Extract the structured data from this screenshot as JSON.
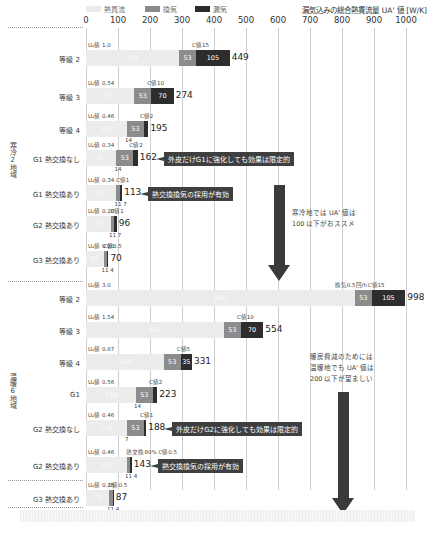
{
  "chart_data": {
    "type": "bar",
    "orientation": "horizontal-stacked",
    "title": "漏気込みの総合熱貫流量 UA' 値 [W/K]",
    "xlim": [
      0,
      1000
    ],
    "xticks": [
      0,
      100,
      200,
      300,
      400,
      500,
      600,
      700,
      800,
      900,
      1000
    ],
    "legend": [
      {
        "name": "熱貫流",
        "color": "#ebebeb"
      },
      {
        "name": "換気",
        "color": "#8a8a8a"
      },
      {
        "name": "漏気",
        "color": "#2b2b2b"
      }
    ],
    "groups": [
      {
        "name": "寒冷2地域",
        "rows": [
          {
            "label": "等級 2",
            "ua": "Uₐ値 1.0",
            "c": "C値15",
            "heat": 291,
            "vent": 53,
            "leak": 105,
            "total": 449
          },
          {
            "label": "等級 3",
            "ua": "Uₐ値 0.54",
            "c": "C値10",
            "heat": 151,
            "vent": 53,
            "leak": 70,
            "total": 274
          },
          {
            "label": "等級 4",
            "ua": "Uₐ値 0.46",
            "c": "C値2",
            "heat": 128,
            "vent": 53,
            "leak": 14,
            "total": 195,
            "below": "14"
          },
          {
            "label": "G1 熱交換なし",
            "ua": "Uₐ値 0.34",
            "c": "C値2",
            "heat": 95,
            "vent": 53,
            "leak": 14,
            "total": 162,
            "below": "14",
            "note": "外皮だけG1に強化しても効果は限定的"
          },
          {
            "label": "G1 熱交換あり",
            "ua": "Uₐ値 0.34",
            "c": "C値1",
            "heat": 95,
            "vent": 11,
            "leak": 7,
            "total": 113,
            "below": "11 7",
            "note": "熱交換換気の採用が有効"
          },
          {
            "label": "G2 熱交換あり",
            "ua": "Uₐ値 0.28",
            "c": "C値1",
            "heat": 78,
            "vent": 11,
            "leak": 7,
            "total": 96,
            "below": "11 7"
          },
          {
            "label": "G3 熱交換あり",
            "ua": "Uₐ値 0.20",
            "c": "C値0.5",
            "heat": 55,
            "vent": 11,
            "leak": 4,
            "total": 70,
            "below": "11 4"
          }
        ],
        "advice": [
          "寒冷地では UA' 値は",
          "100 以下がおススメ"
        ]
      },
      {
        "name": "温暖6地域",
        "rows": [
          {
            "label": "等級 2",
            "ua": "Uₐ値 3.0",
            "c": "C値15",
            "extra": "換気0.5回/h",
            "heat": 840,
            "vent": 53,
            "leak": 105,
            "total": 998
          },
          {
            "label": "等級 3",
            "ua": "Uₐ値 1.54",
            "c": "C値10",
            "heat": 431,
            "vent": 53,
            "leak": 70,
            "total": 554
          },
          {
            "label": "等級 4",
            "ua": "Uₐ値 0.87",
            "c": "C値5",
            "heat": 243,
            "vent": 53,
            "leak": 35,
            "total": 331
          },
          {
            "label": "G1",
            "ua": "Uₐ値 0.56",
            "c": "C値2",
            "heat": 156,
            "vent": 53,
            "leak": 14,
            "total": 223,
            "below": "14"
          },
          {
            "label": "G2 熱交換なし",
            "ua": "Uₐ値 0.46",
            "c": "C値1",
            "heat": 128,
            "vent": 53,
            "leak": 7,
            "total": 188,
            "below": "7",
            "note": "外皮だけG2に強化しても効果は限定的"
          },
          {
            "label": "G2 熱交換あり",
            "ua": "Uₐ値 0.46",
            "c": "熱交換80% C値0.5",
            "heat": 128,
            "vent": 11,
            "leak": 4,
            "total": 143,
            "below": "11 4",
            "note": "熱交換換気の採用が有効"
          },
          {
            "label": "G3 熱交換あり",
            "ua": "Uₐ値 0.26",
            "c": "C値0.5",
            "heat": 72,
            "vent": 11,
            "leak": 4,
            "total": 87,
            "below": "11 4"
          }
        ],
        "advice": [
          "暖房費減のためには",
          "温暖地でも UA' 値は",
          "200 以下が望ましい"
        ]
      }
    ]
  }
}
